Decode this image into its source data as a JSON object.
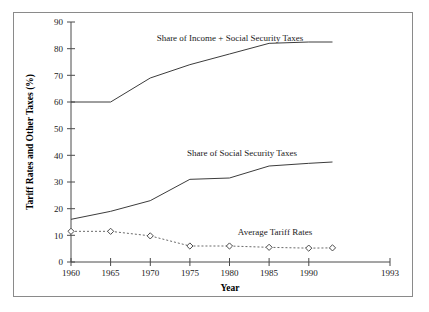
{
  "figure": {
    "frame_border_color": "#8a8a8a",
    "background_color": "#ffffff",
    "line_color": "#3c3c3c",
    "axis_color": "#4a4a4a"
  },
  "axes": {
    "y_title": "Tariff Rates and Other Taxes (%)",
    "x_title": "Year",
    "y_ticks": [
      "90",
      "80",
      "70",
      "60",
      "50",
      "40",
      "30",
      "20",
      "10",
      "0"
    ],
    "x_ticks": [
      "1960",
      "1965",
      "1970",
      "1975",
      "1980",
      "1985",
      "1990",
      "1993"
    ]
  },
  "labels": {
    "series_top": "Share of Income + Social Security Taxes",
    "series_middle": "Share of Social Security Taxes",
    "series_bottom": "Average Tariff Rates"
  },
  "chart_data": {
    "type": "line",
    "title": "",
    "subtitle": "",
    "xlabel": "Year",
    "ylabel": "Tariff Rates and Other Taxes (%)",
    "x": [
      1960,
      1965,
      1970,
      1975,
      1980,
      1985,
      1990,
      1993
    ],
    "xlim": [
      1960,
      1993
    ],
    "ylim": [
      0,
      90
    ],
    "ytick_values": [
      0,
      10,
      20,
      30,
      40,
      50,
      60,
      70,
      80,
      90
    ],
    "grid": false,
    "legend_position": "inline-annotations",
    "series": [
      {
        "name": "Share of Income + Social Security Taxes",
        "style": "solid",
        "marker": "none",
        "values": [
          60,
          60,
          69,
          74,
          78,
          82,
          82.5,
          82.5
        ]
      },
      {
        "name": "Share of Social Security Taxes",
        "style": "solid",
        "marker": "none",
        "values": [
          16,
          19,
          23,
          31,
          31.5,
          36,
          37,
          37.5
        ]
      },
      {
        "name": "Average Tariff Rates",
        "style": "dotted",
        "marker": "diamond",
        "values": [
          11.5,
          11.5,
          9.8,
          6,
          6,
          5.5,
          5.2,
          5.3
        ]
      }
    ],
    "annotations": [
      {
        "text": "Share of Income + Social Security Taxes",
        "x": 1976,
        "y": 86
      },
      {
        "text": "Share of Social Security Taxes",
        "x": 1979,
        "y": 42
      },
      {
        "text": "Average Tariff Rates",
        "x": 1983,
        "y": 11
      }
    ]
  }
}
